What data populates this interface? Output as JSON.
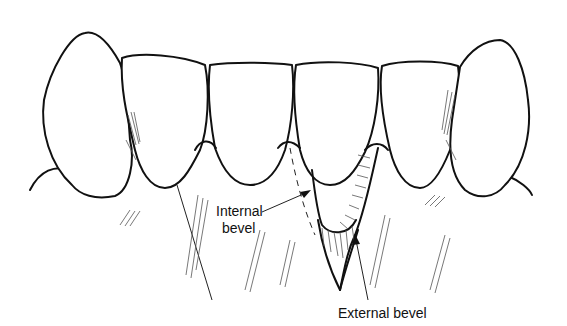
{
  "figure": {
    "labels": {
      "internal_bevel": [
        "Internal",
        "bevel"
      ],
      "external_bevel": "External bevel"
    },
    "colors": {
      "ink": "#111111",
      "background": "#ffffff"
    }
  }
}
